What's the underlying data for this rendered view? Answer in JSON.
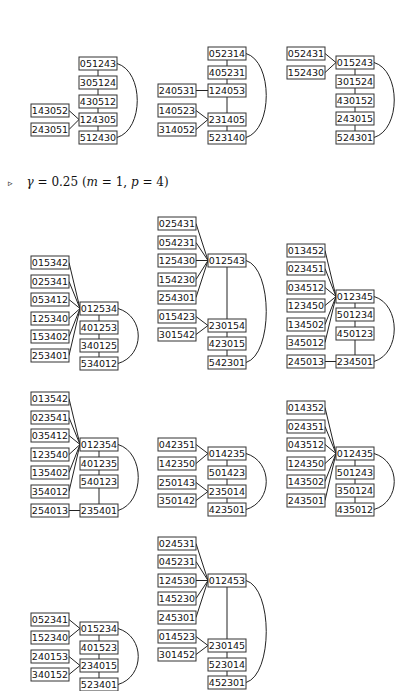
{
  "caption": {
    "marker": "▹",
    "gamma_symbol": "γ",
    "text": " = 0.25 (",
    "m_label": "m",
    "m_value": " = 1, ",
    "p_label": "p",
    "p_value": " = 4)"
  },
  "box": {
    "w": 38,
    "h": 13
  },
  "graphs": [
    {
      "id": "g1",
      "nodes": [
        {
          "id": "051243",
          "x": 79,
          "y": 57
        },
        {
          "id": "305124",
          "x": 79,
          "y": 76
        },
        {
          "id": "430512",
          "x": 79,
          "y": 95
        },
        {
          "id": "124305",
          "x": 79,
          "y": 113
        },
        {
          "id": "512430",
          "x": 79,
          "y": 131
        },
        {
          "id": "143052",
          "x": 31,
          "y": 104
        },
        {
          "id": "243051",
          "x": 31,
          "y": 123
        }
      ],
      "edges": [
        [
          "051243",
          "305124"
        ],
        [
          "305124",
          "430512"
        ],
        [
          "430512",
          "124305"
        ],
        [
          "124305",
          "512430"
        ],
        [
          "143052",
          "124305"
        ],
        [
          "243051",
          "124305"
        ]
      ],
      "arcs": [
        [
          "051243",
          "512430"
        ]
      ]
    },
    {
      "id": "g2",
      "nodes": [
        {
          "id": "052314",
          "x": 208,
          "y": 47
        },
        {
          "id": "405231",
          "x": 208,
          "y": 66
        },
        {
          "id": "124053",
          "x": 208,
          "y": 84
        },
        {
          "id": "231405",
          "x": 208,
          "y": 113
        },
        {
          "id": "523140",
          "x": 208,
          "y": 131
        },
        {
          "id": "240531",
          "x": 158,
          "y": 84
        },
        {
          "id": "140523",
          "x": 158,
          "y": 104
        },
        {
          "id": "314052",
          "x": 158,
          "y": 123
        }
      ],
      "edges": [
        [
          "052314",
          "405231"
        ],
        [
          "405231",
          "124053"
        ],
        [
          "124053",
          "231405"
        ],
        [
          "231405",
          "523140"
        ],
        [
          "240531",
          "124053"
        ],
        [
          "140523",
          "231405"
        ],
        [
          "314052",
          "231405"
        ]
      ],
      "arcs": [
        [
          "052314",
          "523140"
        ]
      ]
    },
    {
      "id": "g3",
      "nodes": [
        {
          "id": "052431",
          "x": 287,
          "y": 47
        },
        {
          "id": "152430",
          "x": 287,
          "y": 66
        },
        {
          "id": "015243",
          "x": 336,
          "y": 56
        },
        {
          "id": "301524",
          "x": 336,
          "y": 75
        },
        {
          "id": "430152",
          "x": 336,
          "y": 94
        },
        {
          "id": "243015",
          "x": 336,
          "y": 112
        },
        {
          "id": "524301",
          "x": 336,
          "y": 131
        }
      ],
      "edges": [
        [
          "015243",
          "301524"
        ],
        [
          "301524",
          "430152"
        ],
        [
          "430152",
          "243015"
        ],
        [
          "243015",
          "524301"
        ],
        [
          "052431",
          "015243"
        ],
        [
          "152430",
          "015243"
        ]
      ],
      "arcs": [
        [
          "015243",
          "524301"
        ]
      ]
    },
    {
      "id": "g4",
      "nodes": [
        {
          "id": "015342",
          "x": 31,
          "y": 256
        },
        {
          "id": "025341",
          "x": 31,
          "y": 275
        },
        {
          "id": "053412",
          "x": 31,
          "y": 293
        },
        {
          "id": "125340",
          "x": 31,
          "y": 312
        },
        {
          "id": "153402",
          "x": 31,
          "y": 330
        },
        {
          "id": "253401",
          "x": 31,
          "y": 349
        },
        {
          "id": "012534",
          "x": 80,
          "y": 302
        },
        {
          "id": "401253",
          "x": 80,
          "y": 321
        },
        {
          "id": "340125",
          "x": 80,
          "y": 339
        },
        {
          "id": "534012",
          "x": 80,
          "y": 357
        }
      ],
      "edges": [
        [
          "012534",
          "401253"
        ],
        [
          "401253",
          "340125"
        ],
        [
          "340125",
          "534012"
        ],
        [
          "015342",
          "012534"
        ],
        [
          "025341",
          "012534"
        ],
        [
          "053412",
          "012534"
        ],
        [
          "125340",
          "012534"
        ],
        [
          "153402",
          "012534"
        ],
        [
          "253401",
          "012534"
        ]
      ],
      "arcs": [
        [
          "012534",
          "534012"
        ]
      ]
    },
    {
      "id": "g5",
      "nodes": [
        {
          "id": "025431",
          "x": 158,
          "y": 217
        },
        {
          "id": "054231",
          "x": 158,
          "y": 236
        },
        {
          "id": "125430",
          "x": 158,
          "y": 254
        },
        {
          "id": "154230",
          "x": 158,
          "y": 273
        },
        {
          "id": "254301",
          "x": 158,
          "y": 291
        },
        {
          "id": "015423",
          "x": 158,
          "y": 310
        },
        {
          "id": "301542",
          "x": 158,
          "y": 328
        },
        {
          "id": "012543",
          "x": 208,
          "y": 254
        },
        {
          "id": "230154",
          "x": 208,
          "y": 319
        },
        {
          "id": "423015",
          "x": 208,
          "y": 337
        },
        {
          "id": "542301",
          "x": 208,
          "y": 356
        }
      ],
      "edges": [
        [
          "012543",
          "230154"
        ],
        [
          "230154",
          "423015"
        ],
        [
          "423015",
          "542301"
        ],
        [
          "025431",
          "012543"
        ],
        [
          "054231",
          "012543"
        ],
        [
          "125430",
          "012543"
        ],
        [
          "154230",
          "012543"
        ],
        [
          "254301",
          "012543"
        ],
        [
          "015423",
          "230154"
        ],
        [
          "301542",
          "230154"
        ]
      ],
      "arcs": [
        [
          "012543",
          "542301"
        ]
      ]
    },
    {
      "id": "g6",
      "nodes": [
        {
          "id": "013452",
          "x": 287,
          "y": 244
        },
        {
          "id": "023451",
          "x": 287,
          "y": 262
        },
        {
          "id": "034512",
          "x": 287,
          "y": 281
        },
        {
          "id": "123450",
          "x": 287,
          "y": 299
        },
        {
          "id": "134502",
          "x": 287,
          "y": 318
        },
        {
          "id": "345012",
          "x": 287,
          "y": 336
        },
        {
          "id": "245013",
          "x": 287,
          "y": 355
        },
        {
          "id": "012345",
          "x": 336,
          "y": 290
        },
        {
          "id": "501234",
          "x": 336,
          "y": 308
        },
        {
          "id": "450123",
          "x": 336,
          "y": 327
        },
        {
          "id": "234501",
          "x": 336,
          "y": 355
        }
      ],
      "edges": [
        [
          "012345",
          "501234"
        ],
        [
          "501234",
          "450123"
        ],
        [
          "450123",
          "234501"
        ],
        [
          "013452",
          "012345"
        ],
        [
          "023451",
          "012345"
        ],
        [
          "034512",
          "012345"
        ],
        [
          "123450",
          "012345"
        ],
        [
          "134502",
          "012345"
        ],
        [
          "345012",
          "012345"
        ],
        [
          "245013",
          "234501"
        ]
      ],
      "arcs": [
        [
          "012345",
          "234501"
        ]
      ]
    },
    {
      "id": "g7",
      "nodes": [
        {
          "id": "013542",
          "x": 31,
          "y": 392
        },
        {
          "id": "023541",
          "x": 31,
          "y": 411
        },
        {
          "id": "035412",
          "x": 31,
          "y": 429
        },
        {
          "id": "123540",
          "x": 31,
          "y": 448
        },
        {
          "id": "135402",
          "x": 31,
          "y": 466
        },
        {
          "id": "354012",
          "x": 31,
          "y": 485
        },
        {
          "id": "254013",
          "x": 31,
          "y": 504
        },
        {
          "id": "012354",
          "x": 80,
          "y": 438
        },
        {
          "id": "401235",
          "x": 80,
          "y": 457
        },
        {
          "id": "540123",
          "x": 80,
          "y": 475
        },
        {
          "id": "235401",
          "x": 80,
          "y": 504
        }
      ],
      "edges": [
        [
          "012354",
          "401235"
        ],
        [
          "401235",
          "540123"
        ],
        [
          "540123",
          "235401"
        ],
        [
          "013542",
          "012354"
        ],
        [
          "023541",
          "012354"
        ],
        [
          "035412",
          "012354"
        ],
        [
          "123540",
          "012354"
        ],
        [
          "135402",
          "012354"
        ],
        [
          "354012",
          "012354"
        ],
        [
          "254013",
          "235401"
        ]
      ],
      "arcs": [
        [
          "012354",
          "235401"
        ]
      ]
    },
    {
      "id": "g8",
      "nodes": [
        {
          "id": "042351",
          "x": 158,
          "y": 438
        },
        {
          "id": "142350",
          "x": 158,
          "y": 457
        },
        {
          "id": "250143",
          "x": 158,
          "y": 476
        },
        {
          "id": "350142",
          "x": 158,
          "y": 494
        },
        {
          "id": "014235",
          "x": 208,
          "y": 447
        },
        {
          "id": "501423",
          "x": 208,
          "y": 466
        },
        {
          "id": "235014",
          "x": 208,
          "y": 485
        },
        {
          "id": "423501",
          "x": 208,
          "y": 503
        }
      ],
      "edges": [
        [
          "014235",
          "501423"
        ],
        [
          "501423",
          "235014"
        ],
        [
          "235014",
          "423501"
        ],
        [
          "042351",
          "014235"
        ],
        [
          "142350",
          "014235"
        ],
        [
          "250143",
          "235014"
        ],
        [
          "350142",
          "235014"
        ]
      ],
      "arcs": [
        [
          "014235",
          "423501"
        ]
      ]
    },
    {
      "id": "g9",
      "nodes": [
        {
          "id": "014352",
          "x": 287,
          "y": 401
        },
        {
          "id": "024351",
          "x": 287,
          "y": 420
        },
        {
          "id": "043512",
          "x": 287,
          "y": 438
        },
        {
          "id": "124350",
          "x": 287,
          "y": 457
        },
        {
          "id": "143502",
          "x": 287,
          "y": 475
        },
        {
          "id": "243501",
          "x": 287,
          "y": 494
        },
        {
          "id": "012435",
          "x": 336,
          "y": 447
        },
        {
          "id": "501243",
          "x": 336,
          "y": 466
        },
        {
          "id": "350124",
          "x": 336,
          "y": 484
        },
        {
          "id": "435012",
          "x": 336,
          "y": 503
        }
      ],
      "edges": [
        [
          "012435",
          "501243"
        ],
        [
          "501243",
          "350124"
        ],
        [
          "350124",
          "435012"
        ],
        [
          "014352",
          "012435"
        ],
        [
          "024351",
          "012435"
        ],
        [
          "043512",
          "012435"
        ],
        [
          "124350",
          "012435"
        ],
        [
          "143502",
          "012435"
        ],
        [
          "243501",
          "012435"
        ]
      ],
      "arcs": [
        [
          "012435",
          "435012"
        ]
      ]
    },
    {
      "id": "g10",
      "nodes": [
        {
          "id": "024531",
          "x": 158,
          "y": 537
        },
        {
          "id": "045231",
          "x": 158,
          "y": 555
        },
        {
          "id": "124530",
          "x": 158,
          "y": 574
        },
        {
          "id": "145230",
          "x": 158,
          "y": 592
        },
        {
          "id": "245301",
          "x": 158,
          "y": 611
        },
        {
          "id": "014523",
          "x": 158,
          "y": 630
        },
        {
          "id": "301452",
          "x": 158,
          "y": 648
        },
        {
          "id": "012453",
          "x": 208,
          "y": 574
        },
        {
          "id": "230145",
          "x": 208,
          "y": 639
        },
        {
          "id": "523014",
          "x": 208,
          "y": 658
        },
        {
          "id": "452301",
          "x": 208,
          "y": 676
        }
      ],
      "edges": [
        [
          "012453",
          "230145"
        ],
        [
          "230145",
          "523014"
        ],
        [
          "523014",
          "452301"
        ],
        [
          "024531",
          "012453"
        ],
        [
          "045231",
          "012453"
        ],
        [
          "124530",
          "012453"
        ],
        [
          "145230",
          "012453"
        ],
        [
          "245301",
          "012453"
        ],
        [
          "014523",
          "230145"
        ],
        [
          "301452",
          "230145"
        ]
      ],
      "arcs": [
        [
          "012453",
          "452301"
        ]
      ]
    },
    {
      "id": "g11",
      "nodes": [
        {
          "id": "052341",
          "x": 31,
          "y": 613
        },
        {
          "id": "152340",
          "x": 31,
          "y": 631
        },
        {
          "id": "240153",
          "x": 31,
          "y": 650
        },
        {
          "id": "340152",
          "x": 31,
          "y": 668
        },
        {
          "id": "015234",
          "x": 80,
          "y": 622
        },
        {
          "id": "401523",
          "x": 80,
          "y": 641
        },
        {
          "id": "234015",
          "x": 80,
          "y": 659
        },
        {
          "id": "523401",
          "x": 80,
          "y": 678
        }
      ],
      "edges": [
        [
          "015234",
          "401523"
        ],
        [
          "401523",
          "234015"
        ],
        [
          "234015",
          "523401"
        ],
        [
          "052341",
          "015234"
        ],
        [
          "152340",
          "015234"
        ],
        [
          "240153",
          "234015"
        ],
        [
          "340152",
          "234015"
        ]
      ],
      "arcs": [
        [
          "015234",
          "523401"
        ]
      ]
    }
  ]
}
